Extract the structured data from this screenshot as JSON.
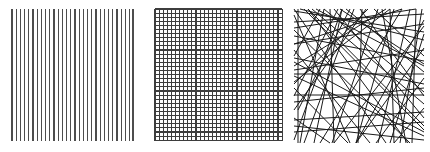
{
  "figure": {
    "background_color": "#ffffff",
    "width": 430,
    "height": 152,
    "panel_count": 3
  },
  "panels": [
    {
      "id": "parallel-lines",
      "label": "Parallel vertical lines",
      "pattern_type": "parallel",
      "stroke_color": "#4d4d4d",
      "stroke_width": 1.15,
      "line_count": 30,
      "spacing_px": 4.2,
      "bounds": {
        "x": 12,
        "y": 9,
        "width": 121,
        "height": 132
      }
    },
    {
      "id": "grid-lines",
      "label": "Orthogonal square grid",
      "pattern_type": "grid",
      "stroke_color": "#3d3d3d",
      "stroke_width": 1.15,
      "vertical_line_count": 32,
      "horizontal_line_count": 33,
      "spacing_px": 4.1,
      "bounds": {
        "x": 155,
        "y": 9,
        "width": 128,
        "height": 132
      }
    },
    {
      "id": "random-lines",
      "label": "Random line process",
      "pattern_type": "random",
      "stroke_color": "#1a1a1a",
      "stroke_width": 1.0,
      "line_count": 62,
      "bounds": {
        "x": 294,
        "y": 9,
        "width": 130,
        "height": 134
      }
    }
  ],
  "chart_data": {
    "type": "line",
    "xlabel": "",
    "ylabel": "",
    "panels": [
      {
        "name": "parallel-lines",
        "description": "30 evenly spaced vertical line segments spanning the panel height",
        "lines": [
          {
            "x1": 12.0,
            "y1": 9,
            "x2": 12.0,
            "y2": 141
          },
          {
            "x1": 16.2,
            "y1": 9,
            "x2": 16.2,
            "y2": 141
          },
          {
            "x1": 20.4,
            "y1": 9,
            "x2": 20.4,
            "y2": 141
          },
          {
            "x1": 24.6,
            "y1": 9,
            "x2": 24.6,
            "y2": 141
          },
          {
            "x1": 28.8,
            "y1": 9,
            "x2": 28.8,
            "y2": 141
          },
          {
            "x1": 33.0,
            "y1": 9,
            "x2": 33.0,
            "y2": 141
          },
          {
            "x1": 37.2,
            "y1": 9,
            "x2": 37.2,
            "y2": 141
          },
          {
            "x1": 41.4,
            "y1": 9,
            "x2": 41.4,
            "y2": 141
          },
          {
            "x1": 45.6,
            "y1": 9,
            "x2": 45.6,
            "y2": 141
          },
          {
            "x1": 49.8,
            "y1": 9,
            "x2": 49.8,
            "y2": 141
          },
          {
            "x1": 54.0,
            "y1": 9,
            "x2": 54.0,
            "y2": 141
          },
          {
            "x1": 58.2,
            "y1": 9,
            "x2": 58.2,
            "y2": 141
          },
          {
            "x1": 62.4,
            "y1": 9,
            "x2": 62.4,
            "y2": 141
          },
          {
            "x1": 66.6,
            "y1": 9,
            "x2": 66.6,
            "y2": 141
          },
          {
            "x1": 70.8,
            "y1": 9,
            "x2": 70.8,
            "y2": 141
          },
          {
            "x1": 75.0,
            "y1": 9,
            "x2": 75.0,
            "y2": 141
          },
          {
            "x1": 79.2,
            "y1": 9,
            "x2": 79.2,
            "y2": 141
          },
          {
            "x1": 83.4,
            "y1": 9,
            "x2": 83.4,
            "y2": 141
          },
          {
            "x1": 87.6,
            "y1": 9,
            "x2": 87.6,
            "y2": 141
          },
          {
            "x1": 91.8,
            "y1": 9,
            "x2": 91.8,
            "y2": 141
          },
          {
            "x1": 96.0,
            "y1": 9,
            "x2": 96.0,
            "y2": 141
          },
          {
            "x1": 100.2,
            "y1": 9,
            "x2": 100.2,
            "y2": 141
          },
          {
            "x1": 104.4,
            "y1": 9,
            "x2": 104.4,
            "y2": 141
          },
          {
            "x1": 108.6,
            "y1": 9,
            "x2": 108.6,
            "y2": 141
          },
          {
            "x1": 112.8,
            "y1": 9,
            "x2": 112.8,
            "y2": 141
          },
          {
            "x1": 117.0,
            "y1": 9,
            "x2": 117.0,
            "y2": 141
          },
          {
            "x1": 121.2,
            "y1": 9,
            "x2": 121.2,
            "y2": 141
          },
          {
            "x1": 125.4,
            "y1": 9,
            "x2": 125.4,
            "y2": 141
          },
          {
            "x1": 129.6,
            "y1": 9,
            "x2": 129.6,
            "y2": 141
          },
          {
            "x1": 133.0,
            "y1": 9,
            "x2": 133.0,
            "y2": 141
          }
        ]
      },
      {
        "name": "grid-lines",
        "description": "Square lattice: 32 vertical and 33 horizontal lines at ~4.1 px pitch",
        "vertical_xs": [
          10.0,
          14.1,
          18.2,
          22.3,
          26.4,
          30.5,
          34.6,
          38.7,
          42.8,
          46.9,
          51.0,
          55.1,
          59.2,
          63.3,
          67.4,
          71.5,
          75.6,
          79.7,
          83.8,
          87.9,
          92.0,
          96.1,
          100.2,
          104.3,
          108.4,
          112.5,
          116.6,
          120.7,
          124.8,
          128.9,
          133.0,
          137.1
        ],
        "horizontal_ys": [
          9.0,
          13.1,
          17.2,
          21.3,
          25.4,
          29.5,
          33.6,
          37.7,
          41.8,
          45.9,
          50.0,
          54.1,
          58.2,
          62.3,
          66.4,
          70.5,
          74.6,
          78.7,
          82.8,
          86.9,
          91.0,
          95.1,
          99.2,
          103.3,
          107.4,
          111.5,
          115.6,
          119.7,
          123.8,
          127.9,
          132.0,
          136.1,
          140.2
        ],
        "vertical_span": {
          "y1": 9,
          "y2": 141
        },
        "horizontal_span": {
          "x1": 10,
          "x2": 137
        }
      },
      {
        "name": "random-lines",
        "description": "Poisson line process: 62 chords at random angles crossing the square window",
        "window": {
          "x1": 4,
          "y1": 9,
          "x2": 134,
          "y2": 143
        },
        "lines": [
          {
            "x1": 4,
            "y1": 22,
            "x2": 134,
            "y2": 14
          },
          {
            "x1": 4,
            "y1": 36,
            "x2": 134,
            "y2": 61
          },
          {
            "x1": 4,
            "y1": 74,
            "x2": 134,
            "y2": 74
          },
          {
            "x1": 4,
            "y1": 95,
            "x2": 134,
            "y2": 95
          },
          {
            "x1": 4,
            "y1": 120,
            "x2": 134,
            "y2": 112
          },
          {
            "x1": 4,
            "y1": 9,
            "x2": 96,
            "y2": 143
          },
          {
            "x1": 18,
            "y1": 9,
            "x2": 118,
            "y2": 143
          },
          {
            "x1": 34,
            "y1": 9,
            "x2": 10,
            "y2": 143
          },
          {
            "x1": 52,
            "y1": 9,
            "x2": 24,
            "y2": 143
          },
          {
            "x1": 70,
            "y1": 9,
            "x2": 134,
            "y2": 96
          },
          {
            "x1": 88,
            "y1": 9,
            "x2": 42,
            "y2": 143
          },
          {
            "x1": 104,
            "y1": 9,
            "x2": 66,
            "y2": 143
          },
          {
            "x1": 120,
            "y1": 9,
            "x2": 88,
            "y2": 143
          },
          {
            "x1": 132,
            "y1": 9,
            "x2": 110,
            "y2": 143
          },
          {
            "x1": 4,
            "y1": 15,
            "x2": 60,
            "y2": 143
          },
          {
            "x1": 4,
            "y1": 50,
            "x2": 80,
            "y2": 143
          },
          {
            "x1": 4,
            "y1": 88,
            "x2": 58,
            "y2": 143
          },
          {
            "x1": 4,
            "y1": 118,
            "x2": 40,
            "y2": 143
          },
          {
            "x1": 134,
            "y1": 26,
            "x2": 44,
            "y2": 143
          },
          {
            "x1": 134,
            "y1": 48,
            "x2": 66,
            "y2": 143
          },
          {
            "x1": 134,
            "y1": 78,
            "x2": 86,
            "y2": 143
          },
          {
            "x1": 134,
            "y1": 108,
            "x2": 104,
            "y2": 143
          },
          {
            "x1": 10,
            "y1": 9,
            "x2": 134,
            "y2": 40
          },
          {
            "x1": 26,
            "y1": 9,
            "x2": 134,
            "y2": 66
          },
          {
            "x1": 44,
            "y1": 9,
            "x2": 134,
            "y2": 118
          },
          {
            "x1": 14,
            "y1": 9,
            "x2": 134,
            "y2": 130
          },
          {
            "x1": 4,
            "y1": 30,
            "x2": 120,
            "y2": 143
          },
          {
            "x1": 4,
            "y1": 62,
            "x2": 134,
            "y2": 132
          },
          {
            "x1": 60,
            "y1": 9,
            "x2": 8,
            "y2": 110
          },
          {
            "x1": 78,
            "y1": 9,
            "x2": 4,
            "y2": 84
          },
          {
            "x1": 96,
            "y1": 9,
            "x2": 4,
            "y2": 66
          },
          {
            "x1": 112,
            "y1": 9,
            "x2": 4,
            "y2": 44
          },
          {
            "x1": 126,
            "y1": 9,
            "x2": 4,
            "y2": 28
          },
          {
            "x1": 8,
            "y1": 9,
            "x2": 8,
            "y2": 143
          },
          {
            "x1": 40,
            "y1": 9,
            "x2": 44,
            "y2": 143
          },
          {
            "x1": 72,
            "y1": 9,
            "x2": 68,
            "y2": 143
          },
          {
            "x1": 100,
            "y1": 9,
            "x2": 104,
            "y2": 143
          },
          {
            "x1": 126,
            "y1": 9,
            "x2": 122,
            "y2": 143
          },
          {
            "x1": 4,
            "y1": 44,
            "x2": 134,
            "y2": 24
          },
          {
            "x1": 4,
            "y1": 58,
            "x2": 134,
            "y2": 84
          },
          {
            "x1": 4,
            "y1": 102,
            "x2": 134,
            "y2": 88
          },
          {
            "x1": 4,
            "y1": 132,
            "x2": 134,
            "y2": 122
          },
          {
            "x1": 4,
            "y1": 11,
            "x2": 134,
            "y2": 32
          },
          {
            "x1": 4,
            "y1": 70,
            "x2": 134,
            "y2": 50
          },
          {
            "x1": 4,
            "y1": 126,
            "x2": 134,
            "y2": 140
          },
          {
            "x1": 22,
            "y1": 9,
            "x2": 134,
            "y2": 104
          },
          {
            "x1": 56,
            "y1": 9,
            "x2": 134,
            "y2": 72
          },
          {
            "x1": 84,
            "y1": 9,
            "x2": 134,
            "y2": 56
          },
          {
            "x1": 30,
            "y1": 9,
            "x2": 4,
            "y2": 56
          },
          {
            "x1": 48,
            "y1": 9,
            "x2": 4,
            "y2": 96
          },
          {
            "x1": 66,
            "y1": 143,
            "x2": 134,
            "y2": 20
          },
          {
            "x1": 30,
            "y1": 143,
            "x2": 112,
            "y2": 9
          },
          {
            "x1": 100,
            "y1": 143,
            "x2": 134,
            "y2": 34
          },
          {
            "x1": 14,
            "y1": 143,
            "x2": 64,
            "y2": 9
          },
          {
            "x1": 116,
            "y1": 143,
            "x2": 92,
            "y2": 9
          },
          {
            "x1": 4,
            "y1": 82,
            "x2": 100,
            "y2": 9
          },
          {
            "x1": 4,
            "y1": 110,
            "x2": 76,
            "y2": 9
          },
          {
            "x1": 4,
            "y1": 140,
            "x2": 52,
            "y2": 9
          },
          {
            "x1": 134,
            "y1": 92,
            "x2": 34,
            "y2": 9
          },
          {
            "x1": 134,
            "y1": 126,
            "x2": 18,
            "y2": 9
          },
          {
            "x1": 134,
            "y1": 64,
            "x2": 50,
            "y2": 9
          },
          {
            "x1": 134,
            "y1": 136,
            "x2": 4,
            "y2": 76
          }
        ]
      }
    ]
  }
}
